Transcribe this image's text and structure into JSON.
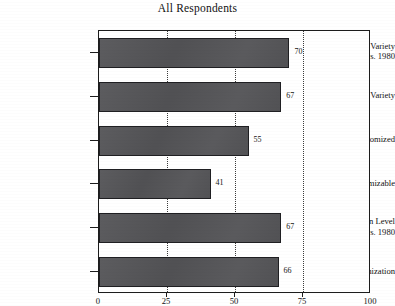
{
  "chart_data": {
    "type": "bar",
    "orientation": "horizontal",
    "title": "All Respondents",
    "xlabel": "",
    "ylabel": "",
    "xlim": [
      0,
      100
    ],
    "xticks": [
      0,
      25,
      50,
      75,
      100
    ],
    "grid": "vertical-dotted",
    "legend": "none",
    "categories": [
      "Amount of Variety 1991 vs. 1980",
      "Future Variety",
      "Extent Customized",
      "Extent Customizable",
      "Customization Level 1991 vs. 1980",
      "Future Customization"
    ],
    "values": [
      70,
      67,
      55,
      41,
      67,
      66
    ],
    "bars": [
      {
        "label_line1": "Amount of Variety",
        "label_line2": "1991 vs. 1980",
        "value": 70,
        "value_text": "70"
      },
      {
        "label_line1": "Future Variety",
        "label_line2": "",
        "value": 67,
        "value_text": "67"
      },
      {
        "label_line1": "Extent Customized",
        "label_line2": "",
        "value": 55,
        "value_text": "55"
      },
      {
        "label_line1": "Extent Customizable",
        "label_line2": "",
        "value": 41,
        "value_text": "41"
      },
      {
        "label_line1": "Customization Level",
        "label_line2": "1991 vs. 1980",
        "value": 67,
        "value_text": "67"
      },
      {
        "label_line1": "Future Customization",
        "label_line2": "",
        "value": 66,
        "value_text": "66"
      }
    ],
    "xtick_labels": [
      "0",
      "25",
      "50",
      "75",
      "100"
    ],
    "colors": {
      "bar_fill": "#555558",
      "bar_edge": "#1f1f22",
      "axis": "#1c1c1c",
      "gridline": "#3b3b3b",
      "text": "#111111",
      "background": "#ffffff"
    }
  }
}
